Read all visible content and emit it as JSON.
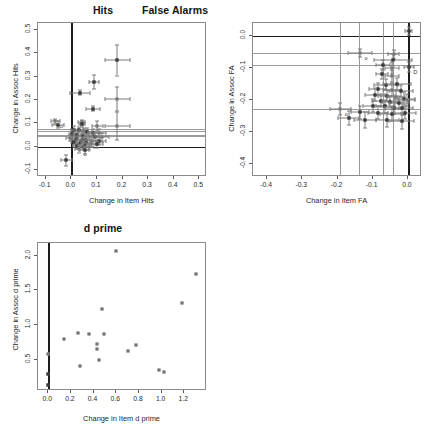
{
  "figure": {
    "background": "#ffffff",
    "point_color": "#4a4a4a",
    "errorbar_color": "#7d7d7d",
    "refline_color": "#1c1c1c"
  },
  "panels": [
    {
      "key": "hits",
      "title": "Hits",
      "chart_data": {
        "type": "scatter",
        "title": "Hits",
        "xlabel": "Change in Item Hits",
        "ylabel": "Change in Assoc Hits",
        "xlim": [
          -0.13,
          0.53
        ],
        "ylim": [
          -0.13,
          0.53
        ],
        "xticks": [
          -0.1,
          0.0,
          0.1,
          0.2,
          0.3,
          0.4,
          0.5
        ],
        "xticklabels": [
          "-0.1",
          "0.0",
          "0.1",
          "0.2",
          "0.3",
          "0.4",
          "0.5"
        ],
        "yticks": [
          -0.1,
          0.0,
          0.1,
          0.2,
          0.3,
          0.4,
          0.5
        ],
        "yticklabels": [
          "-0.1",
          "0.0",
          "0.1",
          "0.2",
          "0.3",
          "0.4",
          "0.5"
        ],
        "grid": false,
        "reference_lines": {
          "vertical": [
            {
              "x": 0.0,
              "style": "major"
            }
          ],
          "horizontal": [
            {
              "y": 0.0,
              "style": "major"
            },
            {
              "y": 0.075,
              "style": "light"
            },
            {
              "y": 0.068,
              "style": "light"
            },
            {
              "y": 0.052,
              "style": "light"
            },
            {
              "y": 0.046,
              "style": "light"
            }
          ]
        },
        "points": [
          {
            "x": 0.18,
            "y": 0.37,
            "xerr": 0.048,
            "yerr": 0.065,
            "filled": true
          },
          {
            "x": 0.088,
            "y": 0.278,
            "xerr": 0.02,
            "yerr": 0.03,
            "filled": true
          },
          {
            "x": 0.035,
            "y": 0.232,
            "xerr": 0.04,
            "yerr": 0.012,
            "filled": true
          },
          {
            "x": 0.18,
            "y": 0.203,
            "xerr": 0.048,
            "yerr": 0.052,
            "filled": false
          },
          {
            "x": 0.085,
            "y": 0.163,
            "xerr": 0.028,
            "yerr": 0.01,
            "filled": true
          },
          {
            "x": 0.18,
            "y": 0.089,
            "xerr": 0.048,
            "yerr": 0.06,
            "filled": false
          },
          {
            "x": -0.062,
            "y": 0.108,
            "xerr": 0.018,
            "yerr": 0.012,
            "filled": false,
            "label": "o"
          },
          {
            "x": -0.052,
            "y": 0.094,
            "xerr": 0.022,
            "yerr": 0.016,
            "filled": true
          },
          {
            "x": 0.04,
            "y": 0.105,
            "xerr": 0.013,
            "yerr": 0.01,
            "filled": false
          },
          {
            "x": 0.042,
            "y": 0.098,
            "xerr": 0.012,
            "yerr": 0.012,
            "filled": true
          },
          {
            "x": 0.102,
            "y": 0.09,
            "xerr": 0.02,
            "yerr": 0.022,
            "filled": false
          },
          {
            "x": 0.012,
            "y": 0.072,
            "xerr": 0.014,
            "yerr": 0.016,
            "filled": true
          },
          {
            "x": 0.03,
            "y": 0.07,
            "xerr": 0.016,
            "yerr": 0.013,
            "filled": true
          },
          {
            "x": 0.048,
            "y": 0.068,
            "xerr": 0.018,
            "yerr": 0.014,
            "filled": false
          },
          {
            "x": 0.062,
            "y": 0.064,
            "xerr": 0.02,
            "yerr": 0.015,
            "filled": true
          },
          {
            "x": 0.086,
            "y": 0.06,
            "xerr": 0.022,
            "yerr": 0.016,
            "filled": true
          },
          {
            "x": 0.108,
            "y": 0.058,
            "xerr": 0.026,
            "yerr": 0.018,
            "filled": false
          },
          {
            "x": 0.004,
            "y": 0.056,
            "xerr": 0.012,
            "yerr": 0.014,
            "filled": true
          },
          {
            "x": 0.022,
            "y": 0.05,
            "xerr": 0.015,
            "yerr": 0.012,
            "filled": true
          },
          {
            "x": 0.044,
            "y": 0.046,
            "xerr": 0.016,
            "yerr": 0.013,
            "filled": true
          },
          {
            "x": 0.068,
            "y": 0.044,
            "xerr": 0.02,
            "yerr": 0.014,
            "filled": false
          },
          {
            "x": 0.092,
            "y": 0.042,
            "xerr": 0.024,
            "yerr": 0.016,
            "filled": true
          },
          {
            "x": 0.12,
            "y": 0.04,
            "xerr": 0.028,
            "yerr": 0.018,
            "filled": false
          },
          {
            "x": -0.006,
            "y": 0.036,
            "xerr": 0.013,
            "yerr": 0.013,
            "filled": false,
            "label": "o"
          },
          {
            "x": 0.018,
            "y": 0.032,
            "xerr": 0.014,
            "yerr": 0.012,
            "filled": true
          },
          {
            "x": 0.04,
            "y": 0.03,
            "xerr": 0.016,
            "yerr": 0.013,
            "filled": true
          },
          {
            "x": 0.058,
            "y": 0.028,
            "xerr": 0.018,
            "yerr": 0.014,
            "filled": true
          },
          {
            "x": 0.08,
            "y": 0.026,
            "xerr": 0.022,
            "yerr": 0.015,
            "filled": false
          },
          {
            "x": 0.11,
            "y": 0.024,
            "xerr": 0.026,
            "yerr": 0.016,
            "filled": true
          },
          {
            "x": 0.01,
            "y": 0.018,
            "xerr": 0.013,
            "yerr": 0.012,
            "filled": true
          },
          {
            "x": 0.034,
            "y": 0.016,
            "xerr": 0.015,
            "yerr": 0.013,
            "filled": true
          },
          {
            "x": 0.056,
            "y": 0.014,
            "xerr": 0.018,
            "yerr": 0.014,
            "filled": true
          },
          {
            "x": 0.076,
            "y": 0.012,
            "xerr": 0.02,
            "yerr": 0.015,
            "filled": false
          },
          {
            "x": 0.1,
            "y": 0.01,
            "xerr": 0.024,
            "yerr": 0.016,
            "filled": true
          },
          {
            "x": 0.022,
            "y": 0.004,
            "xerr": 0.014,
            "yerr": 0.013,
            "filled": true
          },
          {
            "x": 0.048,
            "y": 0.002,
            "xerr": 0.017,
            "yerr": 0.014,
            "filled": true
          },
          {
            "x": 0.07,
            "y": 0.0,
            "xerr": 0.02,
            "yerr": 0.015,
            "filled": false
          },
          {
            "x": 0.03,
            "y": -0.012,
            "xerr": 0.015,
            "yerr": 0.013,
            "filled": false,
            "label": "o"
          },
          {
            "x": 0.052,
            "y": -0.016,
            "xerr": 0.018,
            "yerr": 0.014,
            "filled": true
          },
          {
            "x": -0.02,
            "y": -0.058,
            "xerr": 0.022,
            "yerr": 0.024,
            "filled": true
          }
        ]
      }
    },
    {
      "key": "false_alarms",
      "title": "False Alarms",
      "chart_data": {
        "type": "scatter",
        "title": "False Alarms",
        "xlabel": "Change in Item FA",
        "ylabel": "Change in Assoc FA",
        "xlim": [
          -0.44,
          0.04
        ],
        "ylim": [
          -0.44,
          0.04
        ],
        "xticks": [
          -0.4,
          -0.3,
          -0.2,
          -0.1,
          0.0
        ],
        "xticklabels": [
          "-0.4",
          "-0.3",
          "-0.2",
          "-0.1",
          "0.0"
        ],
        "yticks": [
          -0.4,
          -0.3,
          -0.2,
          -0.1,
          0.0
        ],
        "yticklabels": [
          "-0.4",
          "-0.3",
          "-0.2",
          "-0.1",
          "0.0"
        ],
        "grid": false,
        "reference_lines": {
          "vertical": [
            {
              "x": 0.0,
              "style": "major"
            },
            {
              "x": -0.193,
              "style": "light"
            },
            {
              "x": -0.138,
              "style": "light"
            },
            {
              "x": -0.072,
              "style": "light"
            },
            {
              "x": -0.043,
              "style": "light"
            }
          ],
          "horizontal": [
            {
              "y": 0.0,
              "style": "major"
            },
            {
              "y": -0.052,
              "style": "light"
            },
            {
              "y": -0.092,
              "style": "light"
            },
            {
              "y": -0.228,
              "style": "light"
            }
          ]
        },
        "points": [
          {
            "x": 0.002,
            "y": 0.016,
            "xerr": 0.01,
            "yerr": 0.012,
            "filled": true
          },
          {
            "x": -0.136,
            "y": -0.053,
            "xerr": 0.034,
            "yerr": 0.012,
            "filled": false,
            "label": "o"
          },
          {
            "x": -0.04,
            "y": -0.058,
            "xerr": 0.016,
            "yerr": 0.014,
            "filled": false
          },
          {
            "x": -0.042,
            "y": -0.075,
            "xerr": 0.055,
            "yerr": 0.018,
            "filled": true
          },
          {
            "x": -0.07,
            "y": -0.092,
            "xerr": 0.02,
            "yerr": 0.016,
            "filled": true
          },
          {
            "x": -0.046,
            "y": -0.1,
            "xerr": 0.02,
            "yerr": 0.018,
            "filled": false
          },
          {
            "x": 0.004,
            "y": -0.098,
            "xerr": 0.014,
            "yerr": 0.016,
            "filled": true,
            "label": "D"
          },
          {
            "x": -0.074,
            "y": -0.118,
            "xerr": 0.018,
            "yerr": 0.016,
            "filled": true
          },
          {
            "x": -0.046,
            "y": -0.126,
            "xerr": 0.02,
            "yerr": 0.018,
            "filled": false
          },
          {
            "x": -0.062,
            "y": -0.152,
            "xerr": 0.034,
            "yerr": 0.018,
            "filled": true
          },
          {
            "x": -0.03,
            "y": -0.15,
            "xerr": 0.04,
            "yerr": 0.018,
            "filled": true
          },
          {
            "x": -0.086,
            "y": -0.165,
            "xerr": 0.024,
            "yerr": 0.018,
            "filled": true
          },
          {
            "x": -0.046,
            "y": -0.168,
            "xerr": 0.026,
            "yerr": 0.02,
            "filled": false
          },
          {
            "x": -0.02,
            "y": -0.172,
            "xerr": 0.034,
            "yerr": 0.02,
            "filled": true
          },
          {
            "x": -0.094,
            "y": -0.183,
            "xerr": 0.028,
            "yerr": 0.02,
            "filled": true
          },
          {
            "x": -0.06,
            "y": -0.186,
            "xerr": 0.024,
            "yerr": 0.018,
            "filled": true
          },
          {
            "x": -0.034,
            "y": -0.19,
            "xerr": 0.026,
            "yerr": 0.02,
            "filled": false
          },
          {
            "x": -0.01,
            "y": -0.196,
            "xerr": 0.03,
            "yerr": 0.02,
            "filled": true
          },
          {
            "x": -0.076,
            "y": -0.202,
            "xerr": 0.026,
            "yerr": 0.02,
            "filled": true
          },
          {
            "x": -0.05,
            "y": -0.205,
            "xerr": 0.024,
            "yerr": 0.018,
            "filled": true
          },
          {
            "x": -0.026,
            "y": -0.208,
            "xerr": 0.028,
            "yerr": 0.02,
            "filled": true
          },
          {
            "x": -0.004,
            "y": -0.2,
            "xerr": 0.024,
            "yerr": 0.018,
            "filled": false
          },
          {
            "x": -0.098,
            "y": -0.218,
            "xerr": 0.03,
            "yerr": 0.02,
            "filled": true
          },
          {
            "x": -0.064,
            "y": -0.22,
            "xerr": 0.026,
            "yerr": 0.02,
            "filled": true
          },
          {
            "x": -0.04,
            "y": -0.224,
            "xerr": 0.026,
            "yerr": 0.02,
            "filled": true
          },
          {
            "x": -0.016,
            "y": -0.226,
            "xerr": 0.03,
            "yerr": 0.02,
            "filled": true
          },
          {
            "x": -0.192,
            "y": -0.228,
            "xerr": 0.03,
            "yerr": 0.018,
            "filled": false,
            "label": "o"
          },
          {
            "x": -0.136,
            "y": -0.238,
            "xerr": 0.026,
            "yerr": 0.02,
            "filled": true
          },
          {
            "x": -0.084,
            "y": -0.24,
            "xerr": 0.028,
            "yerr": 0.02,
            "filled": true
          },
          {
            "x": -0.044,
            "y": -0.244,
            "xerr": 0.034,
            "yerr": 0.022,
            "filled": true
          },
          {
            "x": -0.008,
            "y": -0.24,
            "xerr": 0.03,
            "yerr": 0.02,
            "filled": true
          },
          {
            "x": -0.168,
            "y": -0.255,
            "xerr": 0.03,
            "yerr": 0.022,
            "filled": true
          },
          {
            "x": -0.122,
            "y": -0.262,
            "xerr": 0.03,
            "yerr": 0.024,
            "filled": true
          },
          {
            "x": -0.058,
            "y": -0.262,
            "xerr": 0.034,
            "yerr": 0.022,
            "filled": true
          },
          {
            "x": -0.018,
            "y": -0.266,
            "xerr": 0.036,
            "yerr": 0.024,
            "filled": true
          }
        ]
      }
    },
    {
      "key": "d_prime",
      "title": "d prime",
      "chart_data": {
        "type": "scatter",
        "title": "d prime",
        "xlabel": "Change in Item d prime",
        "ylabel": "Change in Assoc d prime",
        "xlim": [
          -0.09,
          1.4
        ],
        "ylim": [
          0.05,
          2.18
        ],
        "xticks": [
          0.0,
          0.2,
          0.4,
          0.6,
          0.8,
          1.0,
          1.2
        ],
        "xticklabels": [
          "0.0",
          "0.2",
          "0.4",
          "0.6",
          "0.8",
          "1.0",
          "1.2"
        ],
        "yticks": [
          0.5,
          1.0,
          1.5,
          2.0
        ],
        "yticklabels": [
          "0.5",
          "1.0",
          "1.5",
          "2.0"
        ],
        "grid": false,
        "reference_lines": {
          "vertical": [
            {
              "x": 0.0,
              "style": "major"
            }
          ],
          "horizontal": []
        },
        "points": [
          {
            "x": 0.6,
            "y": 2.07,
            "filled": false
          },
          {
            "x": 1.3,
            "y": 1.74,
            "filled": false
          },
          {
            "x": 1.18,
            "y": 1.31,
            "filled": false
          },
          {
            "x": 0.47,
            "y": 1.23,
            "filled": false
          },
          {
            "x": 0.26,
            "y": 0.89,
            "filled": false
          },
          {
            "x": 0.36,
            "y": 0.87,
            "filled": false
          },
          {
            "x": 0.49,
            "y": 0.87,
            "filled": false
          },
          {
            "x": 0.14,
            "y": 0.8,
            "filled": false
          },
          {
            "x": 0.77,
            "y": 0.71,
            "filled": false
          },
          {
            "x": 0.43,
            "y": 0.73,
            "filled": false
          },
          {
            "x": 0.43,
            "y": 0.66,
            "filled": false
          },
          {
            "x": 0.7,
            "y": 0.62,
            "filled": false
          },
          {
            "x": 0.0,
            "y": 0.58,
            "filled": false
          },
          {
            "x": 0.45,
            "y": 0.5,
            "filled": false
          },
          {
            "x": 0.28,
            "y": 0.41,
            "filled": false
          },
          {
            "x": 0.98,
            "y": 0.35,
            "filled": false
          },
          {
            "x": 1.02,
            "y": 0.33,
            "filled": false
          },
          {
            "x": 0.0,
            "y": 0.29,
            "filled": true
          },
          {
            "x": 0.0,
            "y": 0.13,
            "filled": true
          }
        ]
      }
    }
  ]
}
